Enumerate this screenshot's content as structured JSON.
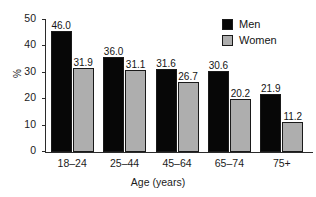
{
  "chart_data": {
    "type": "bar",
    "title": "",
    "subtitle": "",
    "xlabel": "Age (years)",
    "ylabel": "%",
    "categories": [
      "18–24",
      "25–44",
      "45–64",
      "65–74",
      "75+"
    ],
    "series": [
      {
        "name": "Men",
        "color": "#070707",
        "values": [
          46.0,
          36.0,
          31.6,
          30.6,
          21.9
        ]
      },
      {
        "name": "Women",
        "color": "#aeaeae",
        "values": [
          31.9,
          31.1,
          26.7,
          20.2,
          11.2
        ]
      }
    ],
    "value_labels": [
      [
        "46.0",
        "31.9"
      ],
      [
        "36.0",
        "31.1"
      ],
      [
        "31.6",
        "26.7"
      ],
      [
        "30.6",
        "20.2"
      ],
      [
        "21.9",
        "11.2"
      ]
    ],
    "ylim": [
      0,
      50
    ],
    "yticks": [
      0,
      10,
      20,
      30,
      40,
      50
    ],
    "ytick_labels": [
      "0",
      "10",
      "20",
      "30",
      "40",
      "50"
    ],
    "grid": false,
    "legend_position": "top-right",
    "legend": [
      {
        "label": "Men",
        "color": "#070707"
      },
      {
        "label": "Women",
        "color": "#aeaeae"
      }
    ],
    "colors": {
      "men": "#070707",
      "women": "#aeaeae",
      "axis": "#2b2b2b",
      "text": "#141414",
      "background": "#ffffff"
    }
  }
}
